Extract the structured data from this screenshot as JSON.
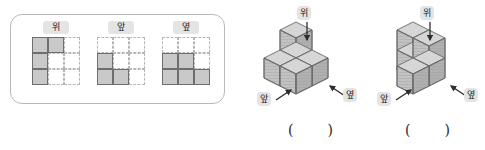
{
  "views_card": {
    "name": "orthographic-views-card",
    "views": [
      {
        "label": "위",
        "label_meaning": "top-view",
        "rows": 3,
        "cols": 3,
        "filled": [
          [
            1,
            1,
            0
          ],
          [
            1,
            0,
            0
          ],
          [
            1,
            0,
            0
          ]
        ]
      },
      {
        "label": "앞",
        "label_meaning": "front-view",
        "rows": 3,
        "cols": 3,
        "filled": [
          [
            0,
            0,
            0
          ],
          [
            1,
            0,
            0
          ],
          [
            1,
            1,
            0
          ]
        ]
      },
      {
        "label": "옆",
        "label_meaning": "side-view",
        "rows": 3,
        "cols": 3,
        "filled": [
          [
            0,
            0,
            0
          ],
          [
            1,
            1,
            0
          ],
          [
            1,
            1,
            1
          ]
        ]
      }
    ]
  },
  "figures": [
    {
      "name": "cube-figure-1",
      "top_label": "위",
      "front_label": "앞",
      "side_label": "옆",
      "answer_open": "(",
      "answer_close": ")",
      "cube_count": 5,
      "cubes": [
        {
          "x": 0,
          "y": 0,
          "z": 0
        },
        {
          "x": 1,
          "y": 0,
          "z": 0
        },
        {
          "x": 0,
          "y": 0,
          "z": 1
        },
        {
          "x": 0,
          "y": 1,
          "z": 0
        },
        {
          "x": 1,
          "y": 1,
          "z": 0
        }
      ]
    },
    {
      "name": "cube-figure-2",
      "top_label": "위",
      "front_label": "앞",
      "side_label": "옆",
      "answer_open": "(",
      "answer_close": ")",
      "cube_count": 5,
      "cubes": [
        {
          "x": 0,
          "y": 0,
          "z": 0
        },
        {
          "x": 1,
          "y": 0,
          "z": 0
        },
        {
          "x": 0,
          "y": 0,
          "z": 1
        },
        {
          "x": 1,
          "y": 0,
          "z": 1
        },
        {
          "x": 1,
          "y": 1,
          "z": 0
        }
      ]
    }
  ],
  "colors": {
    "cube_top": "#d6d6d6",
    "cube_left": "#c2c2c2",
    "cube_right": "#b0b0b0",
    "cube_stroke": "#6a6a6a",
    "grid_fill": "#c9c9c9",
    "grid_solid_stroke": "#6e6e6e",
    "grid_dashed_stroke": "#b6b6b6",
    "badge_bg": "#e4e4e4",
    "card_border": "#b9b9b9",
    "arrow": "#2d2d2d"
  }
}
